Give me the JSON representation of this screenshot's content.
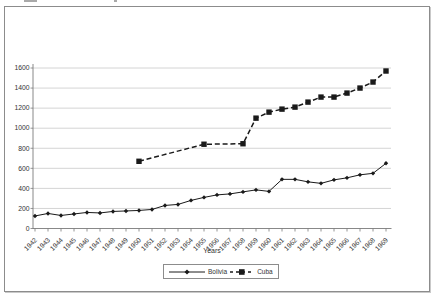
{
  "axis": {
    "x_title": "Years"
  },
  "chart_data": {
    "type": "line",
    "title": "",
    "xlabel": "Years",
    "ylabel": "",
    "x_categories": [
      1942,
      1943,
      1944,
      1945,
      1946,
      1947,
      1948,
      1949,
      1950,
      1951,
      1952,
      1953,
      1954,
      1955,
      1956,
      1957,
      1958,
      1959,
      1960,
      1961,
      1962,
      1963,
      1964,
      1965,
      1966,
      1967,
      1968,
      1969
    ],
    "ylim": [
      0,
      1600
    ],
    "ytick_interval": 200,
    "grid": "horizontal",
    "legend_position": "bottom-center",
    "colors": {
      "line": "#1a1a1a",
      "gridline": "#c9c9c9",
      "axis": "#7a7a7a",
      "text": "#333333"
    },
    "series": [
      {
        "name": "Bolivia",
        "line_style": "solid",
        "marker": "diamond",
        "color": "#1a1a1a",
        "x": [
          1942,
          1943,
          1944,
          1945,
          1946,
          1947,
          1948,
          1949,
          1950,
          1951,
          1952,
          1953,
          1954,
          1955,
          1956,
          1957,
          1958,
          1959,
          1960,
          1961,
          1962,
          1963,
          1964,
          1965,
          1966,
          1967,
          1968,
          1969
        ],
        "values": [
          125,
          150,
          130,
          145,
          160,
          155,
          170,
          175,
          180,
          190,
          230,
          240,
          280,
          310,
          335,
          345,
          365,
          385,
          370,
          490,
          490,
          465,
          450,
          485,
          505,
          535,
          550,
          650
        ]
      },
      {
        "name": "Cuba",
        "line_style": "dashed",
        "marker": "square",
        "color": "#1a1a1a",
        "x": [
          1950,
          1955,
          1958,
          1959,
          1960,
          1961,
          1962,
          1963,
          1964,
          1965,
          1966,
          1967,
          1968,
          1969
        ],
        "values": [
          670,
          840,
          845,
          1100,
          1160,
          1190,
          1210,
          1260,
          1310,
          1310,
          1350,
          1400,
          1460,
          1570
        ]
      }
    ]
  }
}
